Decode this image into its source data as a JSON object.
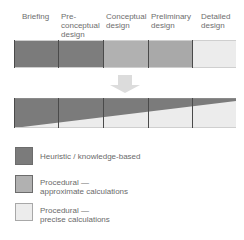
{
  "stages": [
    {
      "label": "Briefing",
      "x": 22
    },
    {
      "label": "Pre-\nconceptual\ndesign",
      "x": 61
    },
    {
      "label": "Conceptual\ndesign",
      "x": 106
    },
    {
      "label": "Preliminary\ndesign",
      "x": 151
    },
    {
      "label": "Detailed\ndesign",
      "x": 201
    }
  ],
  "top_bar": {
    "cells": [
      {
        "stage": "Briefing",
        "method": "Heuristic / knowledge-based",
        "color": "#7b7b7b"
      },
      {
        "stage": "Pre-conceptual design",
        "method": "Heuristic / knowledge-based",
        "color": "#7b7b7b"
      },
      {
        "stage": "Conceptual design",
        "method": "Procedural — approximate calculations",
        "color": "#b1b1b1"
      },
      {
        "stage": "Preliminary design",
        "method": "Procedural — approximate calculations",
        "color": "#a9a9a9"
      },
      {
        "stage": "Detailed design",
        "method": "Procedural — precise calculations",
        "color": "#ececec"
      }
    ]
  },
  "arrow": {
    "direction": "down",
    "color": "#dcdcdc"
  },
  "bottom_bar": {
    "description": "Continuous transition from heuristic (dark, upper) to procedural (light, lower) across stages",
    "dark_color": "#7b7b7b",
    "light_color": "#ececec"
  },
  "legend": [
    {
      "label": "Heuristic / knowledge-based",
      "color": "#7b7b7b"
    },
    {
      "label": "Procedural —\napproximate calculations",
      "color": "#b1b1b1"
    },
    {
      "label": "Procedural —\nprecise calculations",
      "color": "#ececec"
    }
  ]
}
